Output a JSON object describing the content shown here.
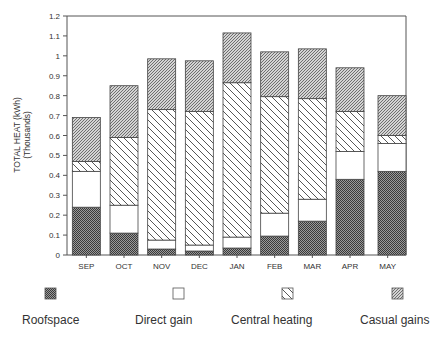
{
  "chart_data": {
    "type": "bar",
    "stacked": true,
    "title": "",
    "xlabel": "",
    "ylabel": "TOTAL HEAT (kWh)",
    "ylabel_sub": "(Thousands)",
    "ylim": [
      0,
      1.2
    ],
    "yticks": [
      "0",
      "0.1",
      "0.2",
      "0.3",
      "0.4",
      "0.5",
      "0.6",
      "0.7",
      "0.8",
      "0.9",
      "1",
      "1.1",
      "1.2"
    ],
    "grid": false,
    "legend_position": "bottom",
    "categories": [
      "SEP",
      "OCT",
      "NOV",
      "DEC",
      "JAN",
      "FEB",
      "MAR",
      "APR",
      "MAY"
    ],
    "series": [
      {
        "name": "Roofspace",
        "pattern": "dense-dots",
        "values": [
          0.24,
          0.11,
          0.03,
          0.02,
          0.035,
          0.095,
          0.17,
          0.38,
          0.42
        ]
      },
      {
        "name": "Direct gain",
        "pattern": "white",
        "values": [
          0.18,
          0.14,
          0.045,
          0.03,
          0.055,
          0.115,
          0.11,
          0.14,
          0.14
        ]
      },
      {
        "name": "Central heating",
        "pattern": "wide-diagonal",
        "values": [
          0.05,
          0.34,
          0.655,
          0.67,
          0.775,
          0.585,
          0.505,
          0.2,
          0.04
        ]
      },
      {
        "name": "Casual gains",
        "pattern": "fine-diagonal",
        "values": [
          0.22,
          0.26,
          0.255,
          0.255,
          0.25,
          0.225,
          0.25,
          0.22,
          0.2
        ]
      }
    ],
    "totals": [
      0.69,
      0.85,
      0.985,
      0.975,
      1.115,
      1.02,
      1.035,
      0.94,
      0.8
    ]
  },
  "legend": {
    "items": [
      "Roofspace",
      "Direct gain",
      "Central heating",
      "Casual gains"
    ]
  }
}
